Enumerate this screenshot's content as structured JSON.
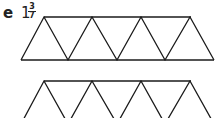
{
  "question": {
    "label": "e",
    "mixed_number": {
      "whole": "1",
      "numerator": "3",
      "denominator": "7"
    }
  },
  "diagram": {
    "stroke_color": "#1a1a1a",
    "rows": [
      {
        "name": "row-1",
        "triangles_up": 4,
        "triangles_down": 3
      },
      {
        "name": "row-2",
        "triangles_up": 4,
        "triangles_down": 3,
        "partially_visible": true
      }
    ]
  }
}
